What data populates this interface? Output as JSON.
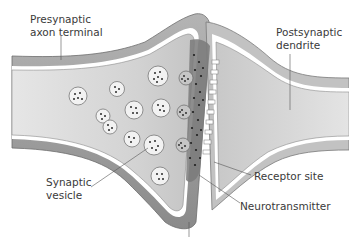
{
  "labels": {
    "presynaptic": {
      "line1": "Presynaptic",
      "line2": "axon terminal"
    },
    "postsynaptic": {
      "line1": "Postsynaptic",
      "line2": "dendrite"
    },
    "vesicle": {
      "line1": "Synaptic",
      "line2": "vesicle"
    },
    "receptor": {
      "line1": "Receptor site"
    },
    "neurotransmitter": {
      "line1": "Neurotransmitter"
    }
  },
  "colors": {
    "membrane": "#9a9a9a",
    "membrane_dark": "#7d7d7d",
    "cytoplasm": "#dcdcdc",
    "cleft": "#6f6f6f",
    "dots": "#2a2a2a",
    "text": "#3a3a3a",
    "leader": "#555555"
  }
}
